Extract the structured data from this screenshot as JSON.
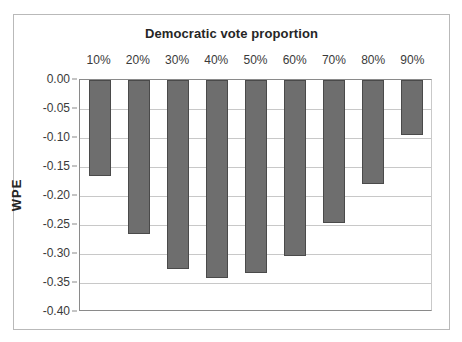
{
  "chart_data": {
    "type": "bar",
    "title": "Democratic vote proportion",
    "xlabel": "",
    "ylabel": "WPE",
    "categories": [
      "10%",
      "20%",
      "30%",
      "40%",
      "50%",
      "60%",
      "70%",
      "80%",
      "90%"
    ],
    "values": [
      -0.165,
      -0.266,
      -0.326,
      -0.341,
      -0.333,
      -0.303,
      -0.247,
      -0.179,
      -0.095
    ],
    "ylim": [
      -0.4,
      0.0
    ],
    "ytick_labels": [
      "0.00",
      "-0.05",
      "-0.10",
      "-0.15",
      "-0.20",
      "-0.25",
      "-0.30",
      "-0.35",
      "-0.40"
    ],
    "ytick_values": [
      0.0,
      -0.05,
      -0.1,
      -0.15,
      -0.2,
      -0.25,
      -0.3,
      -0.35,
      -0.4
    ],
    "grid": true,
    "legend": "none",
    "bar_color": "#6e6e6e",
    "bar_border_color": "#4a4a4a",
    "gridline_color": "#c8c8c8",
    "axis_color": "#8a8a8a",
    "frame_color": "#b9b9b9",
    "background": "#ffffff",
    "text_color": "#3a3a3a",
    "title_color": "#262626",
    "categories_position": "top"
  }
}
